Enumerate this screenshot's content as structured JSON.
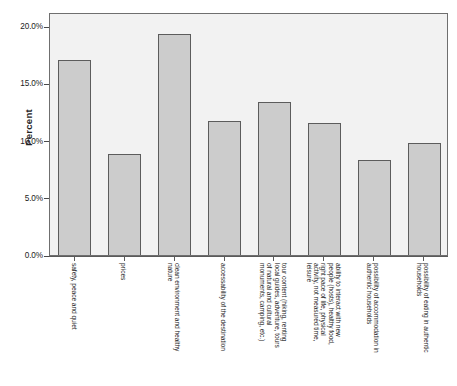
{
  "chart_data": {
    "type": "bar",
    "title": "",
    "subtitle": "",
    "xlabel": "",
    "ylabel": "Percent",
    "ylim": [
      0,
      20
    ],
    "grid": false,
    "legend": null,
    "y_ticks": [
      "0.0%",
      "5.0%",
      "10.0%",
      "15.0%",
      "20.0%"
    ],
    "y_tick_values": [
      0,
      5,
      10,
      15,
      20
    ],
    "value_suffix": "%",
    "categories": [
      "safety, peace and quiet",
      "prices",
      "clean environment and healthy nature",
      "accessability of the destination",
      "tour content (hiking, renting local guides, adventure, tours of natural and cultural monuments, camping, etc.)",
      "ability to interact with new people (hosts), healthy food, right pace of life, physical activity, not measured time, leisure",
      "possibility of accommodation in authentic households",
      "possibility of eating in authentic households"
    ],
    "category_lines": [
      [
        "safety, peace and quiet"
      ],
      [
        "prices"
      ],
      [
        "clean environment and healthy",
        "nature"
      ],
      [
        "accessability of the destination"
      ],
      [
        "tour content (hiking, renting",
        "local guides, adventure, tours",
        "of natural and cultural",
        "monuments, camping, etc.)"
      ],
      [
        "ability to interact with new",
        "people (hosts), healthy food,",
        "right pace of life, physical",
        "activity, not measured time,",
        "leisure"
      ],
      [
        "possibility of accommodation in",
        "authentic households"
      ],
      [
        "possibility of eating in authentic",
        "households"
      ]
    ],
    "values": [
      17.0,
      8.8,
      19.3,
      11.7,
      13.4,
      11.5,
      8.3,
      9.8
    ]
  },
  "style": {
    "bar_fill": "#cccccc",
    "bar_border": "#5c5c5c",
    "plot_background": "#f2f2f2",
    "plot_border": "#6f6f6f",
    "axis_color": "#5a5a5a",
    "text_color": "#262626"
  }
}
